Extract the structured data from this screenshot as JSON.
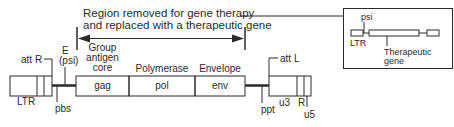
{
  "diagram": {
    "title_line1": "Region removed for gene therapy",
    "title_line2": "and replaced with a therapeutic gene",
    "left_ltr": {
      "label": "LTR",
      "att": "att R"
    },
    "markers": {
      "e_label": "E",
      "psi_label": "(psi)",
      "pbs": "pbs",
      "ppt": "ppt"
    },
    "genes": [
      {
        "name": "gag",
        "caption_lines": [
          "Group",
          "antigen",
          "core"
        ]
      },
      {
        "name": "pol",
        "caption_lines": [
          "Polymerase"
        ]
      },
      {
        "name": "env",
        "caption_lines": [
          "Envelope"
        ]
      }
    ],
    "right_ltr": {
      "att": "att L",
      "u3": "u3",
      "r": "R",
      "u5": "u5"
    },
    "inset": {
      "psi": "psi",
      "ltr": "LTR",
      "gene_line1": "Therapeutic",
      "gene_line2": "gene"
    },
    "colors": {
      "stroke": "#2a2a2a",
      "background": "#ffffff"
    }
  }
}
